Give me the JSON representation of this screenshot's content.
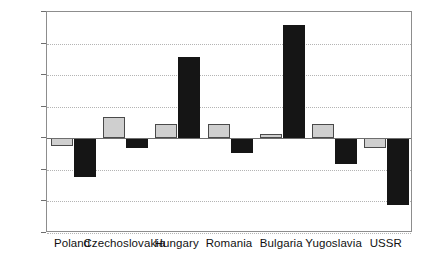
{
  "chart_data": {
    "type": "bar",
    "title": "",
    "subtitle": "",
    "xlabel": "",
    "ylabel": "",
    "ylim": [
      -15,
      20
    ],
    "yticks": [
      20,
      15,
      10,
      5,
      0,
      -5,
      -10,
      -15
    ],
    "ytick_labels": [
      "20",
      "15",
      "10",
      "5",
      "0",
      "-5",
      "-10",
      "-15"
    ],
    "grid": true,
    "legend": "none",
    "categories": [
      "Poland",
      "Czechoslovakia",
      "Hungary",
      "Romania",
      "Bulgaria",
      "Yugoslavia",
      "USSR"
    ],
    "series": [
      {
        "name": "series-light",
        "color": "#cfcfcf",
        "values": [
          -1.2,
          3.3,
          2.2,
          2.2,
          0.7,
          2.3,
          -1.5
        ]
      },
      {
        "name": "series-dark",
        "color": "#151515",
        "values": [
          -6.2,
          -1.6,
          12.8,
          -2.3,
          18.0,
          -4.0,
          -10.5
        ]
      }
    ]
  }
}
